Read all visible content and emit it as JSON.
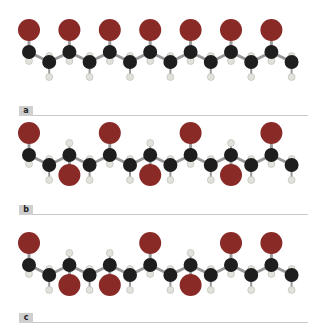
{
  "colors": {
    "carbon": "#1e1e1e",
    "hydrogen": "#e2e2dc",
    "substituent": "#8a2a26",
    "bond": "#9a9a9a",
    "label_tab": "#cfcfcf",
    "label_line": "#c8c8c8"
  },
  "panels": [
    {
      "label": "a",
      "pattern": [
        "up",
        "up",
        "up",
        "up",
        "up",
        "up",
        "up"
      ]
    },
    {
      "label": "b",
      "pattern": [
        "up",
        "down",
        "up",
        "down",
        "up",
        "down",
        "up"
      ]
    },
    {
      "label": "c",
      "pattern": [
        "up",
        "down",
        "down",
        "up",
        "down",
        "up",
        "up"
      ]
    }
  ]
}
